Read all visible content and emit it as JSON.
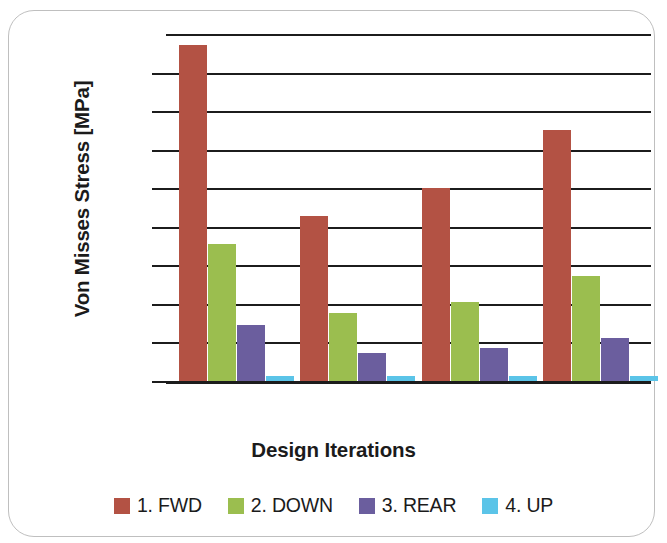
{
  "chart_data": {
    "type": "bar",
    "title": "",
    "xlabel": "Design Iterations",
    "ylabel": "Von Misses Stress [MPa]",
    "categories": [
      "1",
      "2",
      "3",
      "4"
    ],
    "grid": true,
    "gridlines": 10,
    "legend_position": "bottom",
    "ylim": [
      0,
      100
    ],
    "yticks": [
      0,
      10,
      20,
      30,
      40,
      50,
      60,
      70,
      80,
      90,
      100
    ],
    "ytick_labels": [
      "",
      "",
      "",
      "",
      "",
      "",
      "",
      "",
      "",
      "",
      ""
    ],
    "xtick_labels": [
      "",
      "",
      "",
      ""
    ],
    "series": [
      {
        "name": "1. FWD",
        "color": "#B35244",
        "values": [
          96.8,
          47.6,
          55.6,
          72.3
        ]
      },
      {
        "name": "2. DOWN",
        "color": "#9BBE4F",
        "values": [
          39.5,
          19.6,
          22.8,
          30.3
        ]
      },
      {
        "name": "3. REAR",
        "color": "#6B5E9E",
        "values": [
          16.1,
          8.1,
          9.5,
          12.4
        ]
      },
      {
        "name": "4. UP",
        "color": "#5BC4E8",
        "values": [
          1.4,
          1.4,
          1.4,
          1.4
        ]
      }
    ]
  },
  "axes": {
    "y_title": "Von Misses Stress [MPa]",
    "x_title": "Design Iterations"
  },
  "legend": {
    "items": [
      {
        "label": "1. FWD",
        "color": "#B35244"
      },
      {
        "label": "2. DOWN",
        "color": "#9BBE4F"
      },
      {
        "label": "3. REAR",
        "color": "#6B5E9E"
      },
      {
        "label": "4. UP",
        "color": "#5BC4E8"
      }
    ]
  },
  "colors": {
    "gridline": "#1C1C1C",
    "frame_border": "#BFBFBF",
    "text": "#1B1B1B",
    "background": "#FFFFFF"
  }
}
